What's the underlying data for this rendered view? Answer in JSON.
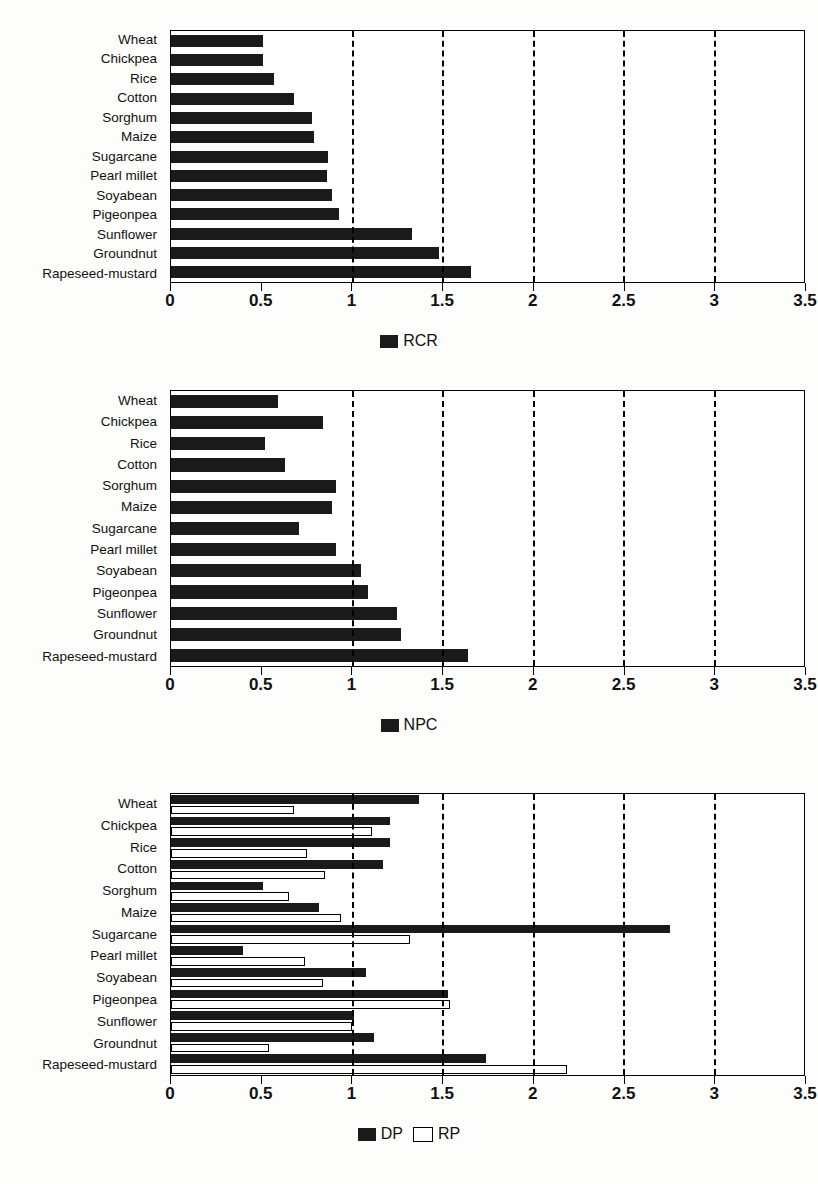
{
  "figure": {
    "axis_min": 0,
    "axis_max": 3.5,
    "tick_labels": [
      "0",
      "0.5",
      "1",
      "1.5",
      "2",
      "2.5",
      "3",
      "3.5"
    ],
    "tick_values": [
      0,
      0.5,
      1,
      1.5,
      2,
      2.5,
      3,
      3.5
    ],
    "gridlines": [
      1,
      1.5,
      2,
      2.5,
      3
    ],
    "bar_color": "#1a1a1a",
    "hollow_color": "#ffffff",
    "axis_color": "#000000"
  },
  "chart_data": [
    {
      "type": "bar",
      "orientation": "horizontal",
      "title": "",
      "xlabel": "",
      "ylabel": "",
      "xlim": [
        0,
        3.5
      ],
      "grid": true,
      "legend_position": "bottom",
      "categories": [
        "Wheat",
        "Chickpea",
        "Rice",
        "Cotton",
        "Sorghum",
        "Maize",
        "Sugarcane",
        "Pearl millet",
        "Soyabean",
        "Pigeonpea",
        "Sunflower",
        "Groundnut",
        "Rapeseed-mustard"
      ],
      "series": [
        {
          "name": "RCR",
          "values": [
            0.51,
            0.51,
            0.57,
            0.68,
            0.78,
            0.79,
            0.87,
            0.86,
            0.89,
            0.93,
            1.33,
            1.48,
            1.66
          ]
        }
      ]
    },
    {
      "type": "bar",
      "orientation": "horizontal",
      "title": "",
      "xlabel": "",
      "ylabel": "",
      "xlim": [
        0,
        3.5
      ],
      "grid": true,
      "legend_position": "bottom",
      "categories": [
        "Wheat",
        "Chickpea",
        "Rice",
        "Cotton",
        "Sorghum",
        "Maize",
        "Sugarcane",
        "Pearl millet",
        "Soyabean",
        "Pigeonpea",
        "Sunflower",
        "Groundnut",
        "Rapeseed-mustard"
      ],
      "series": [
        {
          "name": "NPC",
          "values": [
            0.59,
            0.84,
            0.52,
            0.63,
            0.91,
            0.89,
            0.71,
            0.91,
            1.05,
            1.09,
            1.25,
            1.27,
            1.64
          ]
        }
      ]
    },
    {
      "type": "bar",
      "orientation": "horizontal",
      "title": "",
      "xlabel": "",
      "ylabel": "",
      "xlim": [
        0,
        3.5
      ],
      "grid": true,
      "legend_position": "bottom",
      "categories": [
        "Wheat",
        "Chickpea",
        "Rice",
        "Cotton",
        "Sorghum",
        "Maize",
        "Sugarcane",
        "Pearl millet",
        "Soyabean",
        "Pigeonpea",
        "Sunflower",
        "Groundnut",
        "Rapeseed-mustard"
      ],
      "series": [
        {
          "name": "DP",
          "values": [
            1.37,
            1.21,
            1.21,
            1.17,
            0.51,
            0.82,
            2.76,
            0.4,
            1.08,
            1.53,
            1.01,
            1.12,
            1.74
          ]
        },
        {
          "name": "RP",
          "values": [
            0.68,
            1.11,
            0.75,
            0.85,
            0.65,
            0.94,
            1.32,
            0.74,
            0.84,
            1.54,
            1.0,
            0.54,
            2.19
          ]
        }
      ]
    }
  ]
}
